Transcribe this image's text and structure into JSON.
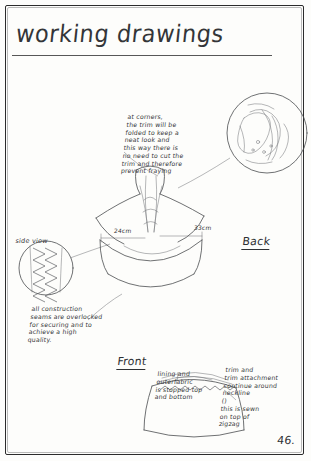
{
  "page": {
    "title": "working drawings",
    "page_number": "46.",
    "background_color": "#fdfdfb",
    "ink_color": "#35373a"
  },
  "annotations": [
    {
      "id": "corners-note",
      "text": "at corners,\nthe trim will be\nfolded to keep a\nneat look and\nthis way there is\nno need to cut the\ntrim and therefore\nprevent fraying",
      "x": 128,
      "y": 113
    },
    {
      "id": "overlocked-seams-note",
      "text": "all construction\nseams are overlocked\nfor securing and to\nachieve a high\nquality.",
      "x": 32,
      "y": 305
    },
    {
      "id": "lining-note",
      "text": "lining and\nouterfabric\nis stopped top\nand bottom",
      "x": 158,
      "y": 370
    },
    {
      "id": "trim-neckline-note",
      "text": "trim and\ntrim attachment\ncontinue around\nneckline\n()\nthis is sewn\non top of\nzigzag",
      "x": 226,
      "y": 368
    }
  ],
  "labels": [
    {
      "id": "back-label",
      "text": "Back",
      "x": 243,
      "y": 243,
      "underline": true
    },
    {
      "id": "front-label",
      "text": "Front",
      "x": 118,
      "y": 362,
      "underline": true
    },
    {
      "id": "side-view-label",
      "text": "side view",
      "x": 16,
      "y": 239,
      "underline": false
    }
  ],
  "dimensions": [
    {
      "id": "dim-24cm",
      "text": "24cm",
      "x": 114,
      "y": 234
    },
    {
      "id": "dim-33cm",
      "text": "33cm",
      "x": 196,
      "y": 231
    }
  ],
  "drawing_elements": [
    {
      "id": "detail-circle-corner",
      "type": "detail-callout-circle"
    },
    {
      "id": "detail-circle-side-seam",
      "type": "detail-callout-circle"
    },
    {
      "id": "garment-back-sketch",
      "type": "garment-sketch"
    },
    {
      "id": "garment-front-sketch",
      "type": "garment-sketch"
    },
    {
      "id": "zigzag-stitch-detail",
      "type": "stitch-detail"
    }
  ]
}
